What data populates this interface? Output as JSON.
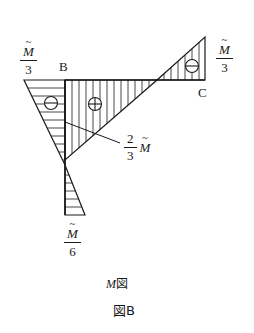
{
  "diagram": {
    "points": {
      "B": "B",
      "C": "C"
    },
    "labels": {
      "left_top": {
        "numerator": "M",
        "denominator": "3"
      },
      "right_top": {
        "numerator": "M",
        "denominator": "3"
      },
      "bottom": {
        "numerator": "M",
        "denominator": "6"
      },
      "middle": {
        "numerator": "2",
        "denominator": "3",
        "symbol": "M"
      }
    },
    "signs": {
      "left": "⊖",
      "middle": "⊕",
      "right": "⊖"
    },
    "caption": {
      "italic": "M",
      "suffix": "図"
    },
    "figure_label": "図B"
  }
}
